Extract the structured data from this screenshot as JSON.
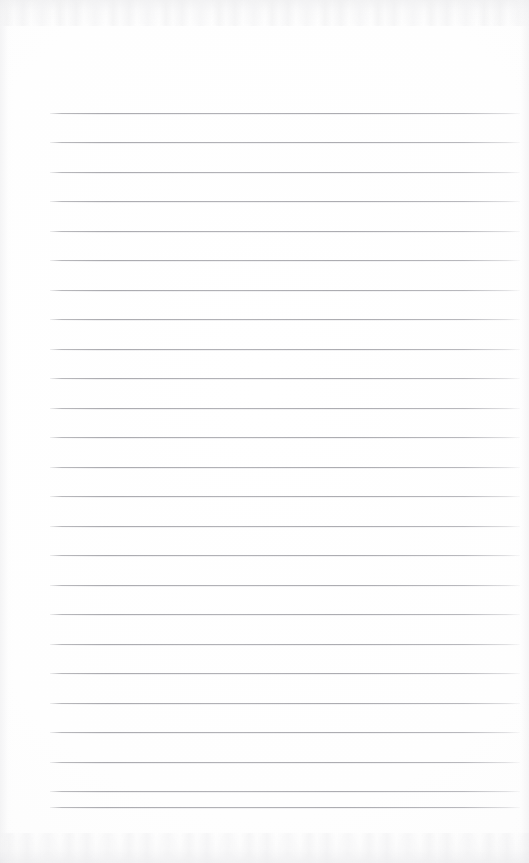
{
  "document": {
    "kind": "scanned-blank-ruled-paper",
    "title": "",
    "body_text": "",
    "header_text": "",
    "footer_text": "",
    "page_number": "",
    "width": 529,
    "height": 863
  },
  "colors": {
    "page_background": "#fdfdfd",
    "rule_line": "#ababb0",
    "rule_line_soft": "#d6d6da",
    "scan_edge_shadow": "#e2e2e5"
  },
  "ruling": {
    "line_count": 25,
    "first_line_y": 113,
    "line_spacing": 29.5,
    "line_start_x": 50,
    "line_end_x": 520,
    "line_thickness": 1,
    "margin_rule_visible": false,
    "lines": [
      {
        "index": 1,
        "y": 113,
        "x1": 50,
        "x2": 520,
        "content": ""
      },
      {
        "index": 2,
        "y": 142,
        "x1": 50,
        "x2": 520,
        "content": ""
      },
      {
        "index": 3,
        "y": 172,
        "x1": 50,
        "x2": 520,
        "content": ""
      },
      {
        "index": 4,
        "y": 201,
        "x1": 50,
        "x2": 520,
        "content": ""
      },
      {
        "index": 5,
        "y": 231,
        "x1": 50,
        "x2": 520,
        "content": ""
      },
      {
        "index": 6,
        "y": 260,
        "x1": 50,
        "x2": 520,
        "content": ""
      },
      {
        "index": 7,
        "y": 290,
        "x1": 50,
        "x2": 520,
        "content": ""
      },
      {
        "index": 8,
        "y": 319,
        "x1": 50,
        "x2": 520,
        "content": ""
      },
      {
        "index": 9,
        "y": 349,
        "x1": 50,
        "x2": 520,
        "content": ""
      },
      {
        "index": 10,
        "y": 378,
        "x1": 50,
        "x2": 520,
        "content": ""
      },
      {
        "index": 11,
        "y": 408,
        "x1": 50,
        "x2": 520,
        "content": ""
      },
      {
        "index": 12,
        "y": 437,
        "x1": 50,
        "x2": 520,
        "content": ""
      },
      {
        "index": 13,
        "y": 467,
        "x1": 50,
        "x2": 520,
        "content": ""
      },
      {
        "index": 14,
        "y": 496,
        "x1": 50,
        "x2": 520,
        "content": ""
      },
      {
        "index": 15,
        "y": 526,
        "x1": 50,
        "x2": 520,
        "content": ""
      },
      {
        "index": 16,
        "y": 555,
        "x1": 50,
        "x2": 520,
        "content": ""
      },
      {
        "index": 17,
        "y": 585,
        "x1": 50,
        "x2": 520,
        "content": ""
      },
      {
        "index": 18,
        "y": 614,
        "x1": 50,
        "x2": 520,
        "content": ""
      },
      {
        "index": 19,
        "y": 644,
        "x1": 50,
        "x2": 520,
        "content": ""
      },
      {
        "index": 20,
        "y": 673,
        "x1": 50,
        "x2": 520,
        "content": ""
      },
      {
        "index": 21,
        "y": 703,
        "x1": 50,
        "x2": 520,
        "content": ""
      },
      {
        "index": 22,
        "y": 732,
        "x1": 50,
        "x2": 520,
        "content": ""
      },
      {
        "index": 23,
        "y": 762,
        "x1": 50,
        "x2": 520,
        "content": ""
      },
      {
        "index": 24,
        "y": 791,
        "x1": 50,
        "x2": 520,
        "content": ""
      },
      {
        "index": 25,
        "y": 807,
        "x1": 50,
        "x2": 520,
        "content": ""
      }
    ]
  }
}
